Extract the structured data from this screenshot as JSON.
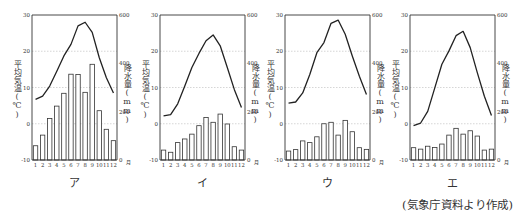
{
  "figure": {
    "source_caption": "(気象庁資料より作成)",
    "left_axis_label": "平均気温(℃)",
    "right_axis_label": "降水量(mm)",
    "x_unit": "月",
    "left_ticks": [
      "30",
      "20",
      "10",
      "0",
      "-10"
    ],
    "right_ticks": [
      "600",
      "400",
      "200",
      "0"
    ],
    "months": [
      "1",
      "2",
      "3",
      "4",
      "5",
      "6",
      "7",
      "8",
      "9",
      "10",
      "11",
      "12"
    ],
    "colors": {
      "line": "#222222",
      "bar_stroke": "#333333",
      "bar_fill": "#ffffff",
      "axis": "#333333",
      "grid": "#bbbbbb"
    }
  },
  "chart_data": [
    {
      "type": "bar+line",
      "title": "ア",
      "categories": [
        "1",
        "2",
        "3",
        "4",
        "5",
        "6",
        "7",
        "8",
        "9",
        "10",
        "11",
        "12"
      ],
      "xlabel": "月",
      "ylabel_left": "平均気温(℃)",
      "ylabel_right": "降水量(mm)",
      "ylim_left": [
        -10,
        30
      ],
      "ylim_right": [
        0,
        600
      ],
      "grid": true,
      "series": [
        {
          "name": "平均気温(℃)",
          "type": "line",
          "axis": "left",
          "values": [
            6.7,
            7.6,
            10.4,
            14.5,
            18.7,
            21.9,
            27.0,
            28.0,
            25.2,
            18.2,
            12.7,
            8.5
          ]
        },
        {
          "name": "降水量(mm)",
          "type": "bar",
          "axis": "right",
          "values": [
            59,
            103,
            172,
            223,
            276,
            355,
            354,
            280,
            396,
            204,
            127,
            80
          ]
        }
      ]
    },
    {
      "type": "bar+line",
      "title": "イ",
      "categories": [
        "1",
        "2",
        "3",
        "4",
        "5",
        "6",
        "7",
        "8",
        "9",
        "10",
        "11",
        "12"
      ],
      "xlabel": "月",
      "ylabel_left": "平均気温(℃)",
      "ylabel_right": "降水量(mm)",
      "ylim_left": [
        -10,
        30
      ],
      "ylim_right": [
        0,
        600
      ],
      "grid": true,
      "series": [
        {
          "name": "平均気温(℃)",
          "type": "line",
          "axis": "left",
          "values": [
            2.2,
            2.5,
            5.5,
            10.4,
            15.5,
            19.4,
            22.9,
            24.5,
            21.5,
            15.5,
            9.4,
            4.5
          ]
        },
        {
          "name": "降水量(mm)",
          "type": "bar",
          "axis": "right",
          "values": [
            41,
            32,
            72,
            87,
            107,
            142,
            176,
            156,
            190,
            149,
            55,
            41
          ]
        }
      ]
    },
    {
      "type": "bar+line",
      "title": "ウ",
      "categories": [
        "1",
        "2",
        "3",
        "4",
        "5",
        "6",
        "7",
        "8",
        "9",
        "10",
        "11",
        "12"
      ],
      "xlabel": "月",
      "ylabel_left": "平均気温(℃)",
      "ylabel_right": "降水量(mm)",
      "ylim_left": [
        -10,
        30
      ],
      "ylim_right": [
        0,
        600
      ],
      "grid": true,
      "series": [
        {
          "name": "平均気温(℃)",
          "type": "line",
          "axis": "left",
          "values": [
            5.7,
            6.0,
            8.5,
            13.6,
            19.6,
            22.4,
            27.7,
            28.6,
            24.7,
            18.7,
            13.1,
            8.1
          ]
        },
        {
          "name": "降水量(mm)",
          "type": "bar",
          "axis": "right",
          "values": [
            37,
            43,
            79,
            72,
            96,
            150,
            156,
            103,
            164,
            117,
            51,
            44
          ]
        }
      ]
    },
    {
      "type": "bar+line",
      "title": "エ",
      "categories": [
        "1",
        "2",
        "3",
        "4",
        "5",
        "6",
        "7",
        "8",
        "9",
        "10",
        "11",
        "12"
      ],
      "xlabel": "月",
      "ylabel_left": "平均気温(℃)",
      "ylabel_right": "降水量(mm)",
      "ylim_left": [
        -10,
        30
      ],
      "ylim_right": [
        0,
        600
      ],
      "grid": true,
      "series": [
        {
          "name": "平均気温(℃)",
          "type": "line",
          "axis": "left",
          "values": [
            -0.5,
            0.2,
            3.4,
            9.9,
            16.4,
            20.1,
            24.3,
            25.5,
            21.0,
            14.1,
            7.6,
            2.3
          ]
        },
        {
          "name": "降水量(mm)",
          "type": "bar",
          "axis": "right",
          "values": [
            51,
            45,
            57,
            52,
            66,
            103,
            131,
            107,
            121,
            99,
            41,
            45
          ]
        }
      ]
    }
  ],
  "layout_positions": [
    {
      "left": 32,
      "right": 117
    },
    {
      "left": 160,
      "right": 245
    },
    {
      "left": 285,
      "right": 370
    },
    {
      "left": 410,
      "right": 495
    }
  ]
}
